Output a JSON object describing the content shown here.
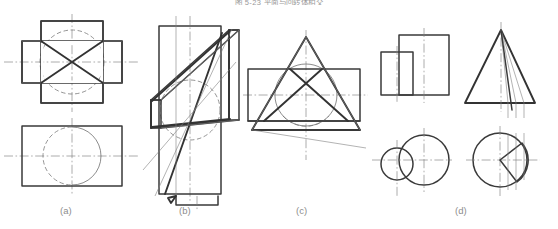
{
  "figure": {
    "title": "图 5-23  平面与回转体相交",
    "width": 558,
    "height": 229,
    "background_color": "#ffffff",
    "line_color_solid": "#333333",
    "line_color_thin": "#6b6b6b",
    "line_color_center": "#7a7a7a",
    "line_color_hidden": "#777777",
    "caption_color": "#8d8d8d"
  },
  "subfigures": [
    {
      "id": "a",
      "label": "(a)",
      "label_x": 60,
      "label_y": 208,
      "description": "cylinder cut by four planes, top view cross shape with inscribed circle and diagonals, front view rectangle with circle"
    },
    {
      "id": "b",
      "label": "(b)",
      "label_x": 179,
      "label_y": 208,
      "description": "cylinder cut by oblique plane, tall rectangle with slanted parallelogram and ellipse intersection"
    },
    {
      "id": "c",
      "label": "(c)",
      "label_x": 296,
      "label_y": 208,
      "description": "cone cut by plane, triangle over rectangle with inscribed circle"
    },
    {
      "id": "d",
      "label": "(d)",
      "label_x": 455,
      "label_y": 208,
      "description": "cone and cylinder views, two rectangles and two circles, cone triangle with element lines and circle with sector"
    }
  ]
}
